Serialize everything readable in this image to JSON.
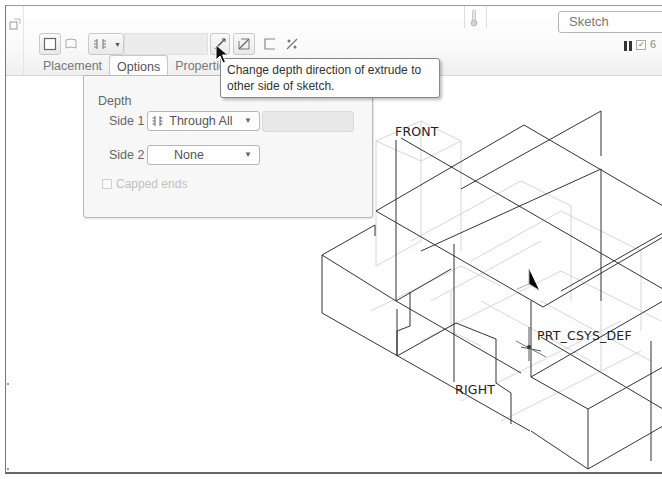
{
  "ribbon": {
    "sketch_box_value": "Sketch",
    "depth_value": "",
    "icons": {
      "corner": "window-restore-icon",
      "solid": "solid-body-icon",
      "surface": "surface-icon",
      "depth_type": "through-all-depth-icon",
      "flip_direction": "flip-depth-direction-icon",
      "remove_material": "remove-material-icon",
      "thicken": "thicken-sketch-icon",
      "taper": "taper-icon",
      "thermometer": "thermometer-icon",
      "pause": "pause-icon"
    }
  },
  "tabs": [
    {
      "label": "Placement",
      "active": false
    },
    {
      "label": "Options",
      "active": true
    },
    {
      "label": "Properties",
      "active": false
    }
  ],
  "tooltip": {
    "text": "Change depth direction of extrude to other side of sketch."
  },
  "options_panel": {
    "section_title": "Depth",
    "side1": {
      "label": "Side 1",
      "value": "Through All",
      "icon": "through-all-icon"
    },
    "side2": {
      "label": "Side 2",
      "value": "None"
    },
    "capped_ends": {
      "label": "Capped ends",
      "checked": false,
      "enabled": false
    }
  },
  "viewport": {
    "datum_labels": {
      "front": "FRONT",
      "right": "RIGHT",
      "csys": "PRT_CSYS_DEF"
    }
  },
  "colors": {
    "edge": "#333333",
    "hidden_edge": "#d4d4d4",
    "panel_bg": "#f7f7f7",
    "tooltip_border": "#888888"
  }
}
